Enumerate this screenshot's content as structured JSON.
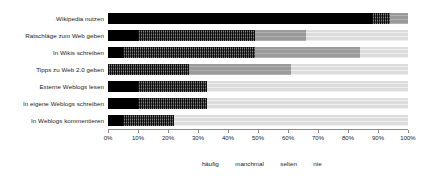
{
  "chart_data": {
    "type": "bar",
    "orientation": "horizontal",
    "stacked": true,
    "stacked_mode": "percent",
    "title": "",
    "subtitle": "",
    "xlabel": "",
    "ylabel": "",
    "xlim": [
      0,
      100
    ],
    "grid": false,
    "legend_position": "bottom",
    "legend": [
      "häufig",
      "manchmal",
      "selten",
      "nie"
    ],
    "categories": [
      "Wikipedia nutzen",
      "Ratschläge zum Web geben",
      "In Wikis schreiben",
      "Tipps zu Web 2.0 geben",
      "Externe Weblogs lesen",
      "In eigene Weblogs schreiben",
      "In Weblogs kommentieren"
    ],
    "xticks": [
      0,
      10,
      20,
      30,
      40,
      50,
      60,
      70,
      80,
      90,
      100
    ],
    "xticklabels": [
      "0%",
      "10%",
      "20%",
      "30%",
      "40%",
      "50%",
      "60%",
      "70%",
      "80%",
      "90%",
      "100%"
    ],
    "series": [
      {
        "name": "häufig",
        "color": "#000000",
        "values": [
          88,
          10,
          5,
          0,
          10,
          10,
          5
        ]
      },
      {
        "name": "manchmal",
        "color": "#4a4a4a",
        "values": [
          6,
          39,
          44,
          27,
          23,
          23,
          17
        ]
      },
      {
        "name": "selten",
        "color": "#9a9a9a",
        "values": [
          6,
          17,
          35,
          34,
          0,
          0,
          0
        ]
      },
      {
        "name": "nie",
        "color": "#dcdcdc",
        "values": [
          0,
          34,
          16,
          39,
          67,
          67,
          78
        ]
      }
    ]
  }
}
